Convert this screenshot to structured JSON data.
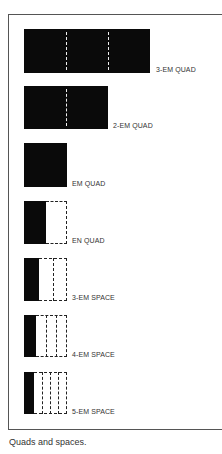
{
  "figure": {
    "caption": "Quads and spaces.",
    "items": [
      {
        "label": "3-EM QUAD",
        "type": "quad",
        "width_em": 3
      },
      {
        "label": "2-EM QUAD",
        "type": "quad",
        "width_em": 2
      },
      {
        "label": "EM QUAD",
        "type": "quad",
        "width_em": 1
      },
      {
        "label": "EN QUAD",
        "type": "space",
        "fraction": "1/2"
      },
      {
        "label": "3-EM SPACE",
        "type": "space",
        "fraction": "1/3"
      },
      {
        "label": "4-EM SPACE",
        "type": "space",
        "fraction": "1/4"
      },
      {
        "label": "5-EM SPACE",
        "type": "space",
        "fraction": "1/5"
      }
    ]
  }
}
